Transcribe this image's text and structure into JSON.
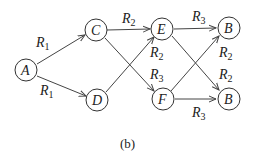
{
  "diagram": {
    "nodes": [
      {
        "id": "A",
        "label": "A"
      },
      {
        "id": "C",
        "label": "C"
      },
      {
        "id": "D",
        "label": "D"
      },
      {
        "id": "E",
        "label": "E"
      },
      {
        "id": "F",
        "label": "F"
      },
      {
        "id": "B1",
        "label": "B"
      },
      {
        "id": "B2",
        "label": "B"
      }
    ],
    "edges": [
      {
        "from": "A",
        "to": "C",
        "label": "R",
        "sub": "1"
      },
      {
        "from": "A",
        "to": "D",
        "label": "R",
        "sub": "1"
      },
      {
        "from": "C",
        "to": "E",
        "label": "R",
        "sub": "2"
      },
      {
        "from": "D",
        "to": "E",
        "label": "R",
        "sub": "2"
      },
      {
        "from": "C",
        "to": "F",
        "label": "R",
        "sub": "3"
      },
      {
        "from": "E",
        "to": "B1",
        "label": "R",
        "sub": "3"
      },
      {
        "from": "F",
        "to": "B1",
        "label": "R",
        "sub": "2"
      },
      {
        "from": "E",
        "to": "B2",
        "label": "R",
        "sub": "2"
      },
      {
        "from": "F",
        "to": "B2",
        "label": "R",
        "sub": "3"
      }
    ],
    "caption": "(b)"
  }
}
